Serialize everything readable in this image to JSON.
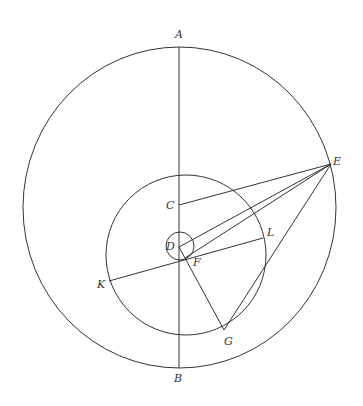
{
  "labels": {
    "A": "A",
    "B": "B",
    "C": "C",
    "D": "D",
    "E": "E",
    "F": "F",
    "G": "G",
    "K": "K",
    "L": "L"
  }
}
